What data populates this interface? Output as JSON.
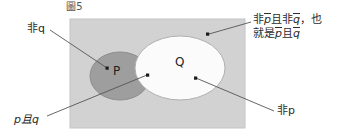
{
  "figure": {
    "caption": "圖5",
    "universe_rect": {
      "x": 70,
      "y": 19,
      "width": 175,
      "height": 109,
      "fill": "#d2d2d2",
      "stroke": "#bdbdbd"
    },
    "sets": [
      {
        "name": "P",
        "label": "P",
        "shape": "ellipse",
        "cx": 120,
        "cy": 76,
        "rx": 30,
        "ry": 24,
        "fill": "#9e9e9e",
        "stroke": "#8a8a8a"
      },
      {
        "name": "Q",
        "label": "Q",
        "shape": "ellipse",
        "cx": 180,
        "cy": 68,
        "rx": 45,
        "ry": 32,
        "fill": "#fbfbfb",
        "stroke": "#b5b5b5"
      }
    ]
  },
  "annotations": {
    "not_q": {
      "text": "非q",
      "dot": {
        "x": 108,
        "y": 69
      },
      "line": {
        "x1": 50,
        "y1": 30,
        "x2": 107,
        "y2": 68
      }
    },
    "p_and_q": {
      "text": "p且q",
      "dot": {
        "x": 148,
        "y": 75
      },
      "line": {
        "x1": 47,
        "y1": 115,
        "x2": 147,
        "y2": 75
      }
    },
    "not_p": {
      "text": "非p",
      "dot": {
        "x": 194,
        "y": 77
      },
      "line": {
        "x1": 275,
        "y1": 110,
        "x2": 195,
        "y2": 78
      }
    },
    "complement": {
      "line1_prefix": "非",
      "line1_p": "p",
      "line1_mid": "且非",
      "line1_q": "q",
      "line1_suffix": "，也",
      "line2_prefix": "就是",
      "line2_p": "p",
      "line2_mid": "且",
      "line2_q": "q",
      "dot": {
        "x": 207,
        "y": 34
      },
      "line": {
        "x1": 250,
        "y1": 22,
        "x2": 208,
        "y2": 34
      }
    }
  },
  "colors": {
    "background": "#ffffff",
    "universe_fill": "#d2d2d2",
    "p_fill": "#9e9e9e",
    "q_fill": "#fbfbfb",
    "text": "#2b2b2b",
    "leader_line": "#555555"
  }
}
